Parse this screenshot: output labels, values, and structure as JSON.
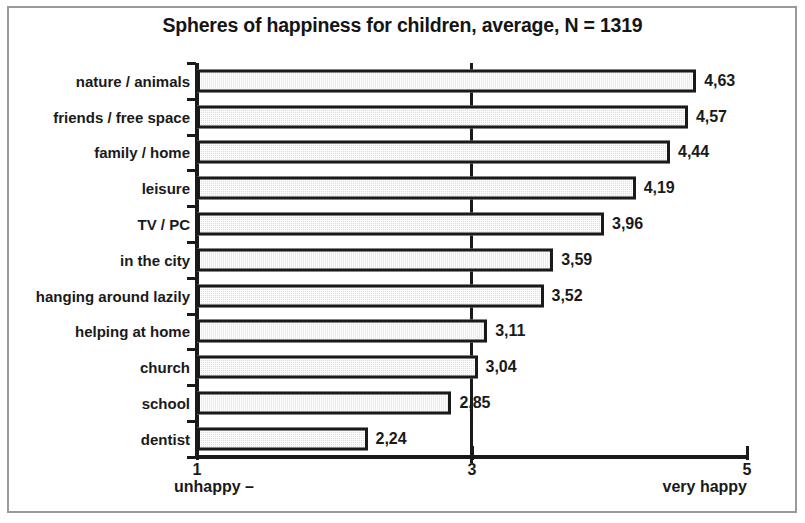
{
  "chart_data": {
    "type": "bar",
    "orientation": "horizontal",
    "title": "Spheres of happiness for children, average, N = 1319",
    "xlabel": "",
    "ylabel": "",
    "xlim": [
      1,
      5
    ],
    "xticks": [
      "1",
      "3",
      "5"
    ],
    "xtick_values": [
      1,
      3,
      5
    ],
    "grid": false,
    "legend": null,
    "sample_size": 1319,
    "decimal_separator": ",",
    "axis_endcap_left": "unhappy   –",
    "axis_endcap_right": "very happy",
    "categories": [
      "nature / animals",
      "friends / free space",
      "family / home",
      "leisure",
      "TV / PC",
      "in the city",
      "hanging around lazily",
      "helping at home",
      "church",
      "school",
      "dentist"
    ],
    "values": [
      4.63,
      4.57,
      4.44,
      4.19,
      3.96,
      3.59,
      3.52,
      3.11,
      3.04,
      2.85,
      2.24
    ],
    "value_labels": [
      "4,63",
      "4,57",
      "4,44",
      "4,19",
      "3,96",
      "3,59",
      "3,52",
      "3,11",
      "3,04",
      "2,85",
      "2,24"
    ],
    "bar_fill_color": "#dededd",
    "bar_border_color": "#1a1a1a",
    "text_color": "#1a1a1a",
    "frame_color": "#9a9a9a",
    "background_color": "#ffffff"
  }
}
